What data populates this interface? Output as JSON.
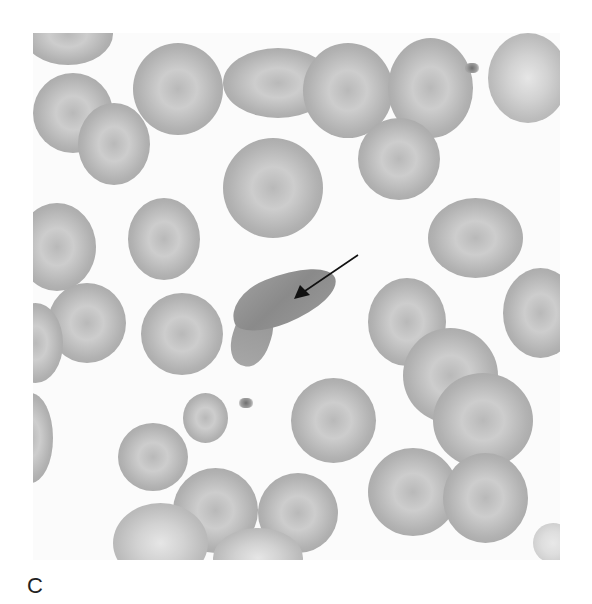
{
  "figure": {
    "panel_label": "C",
    "annotation": {
      "type": "arrow",
      "points_to": "sickle-cell",
      "color": "#111111"
    },
    "colors": {
      "background": "#fbfbfb",
      "cell": "#b5b5b5",
      "sickle_cell": "#8f8f8f"
    }
  }
}
